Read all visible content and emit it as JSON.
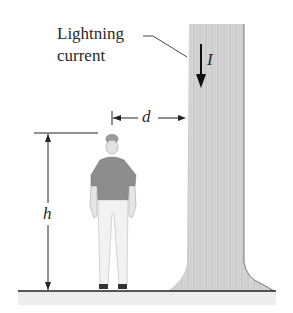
{
  "figure": {
    "labels": {
      "lightning_line1": "Lightning",
      "lightning_line2": "current",
      "current_symbol": "I",
      "distance_symbol": "d",
      "height_symbol": "h"
    },
    "colors": {
      "line": "#222222",
      "trunk": "#d4d4d4",
      "ground": "#ececec",
      "shirt": "#8a8a8a",
      "pants": "#f0f0f0"
    }
  }
}
